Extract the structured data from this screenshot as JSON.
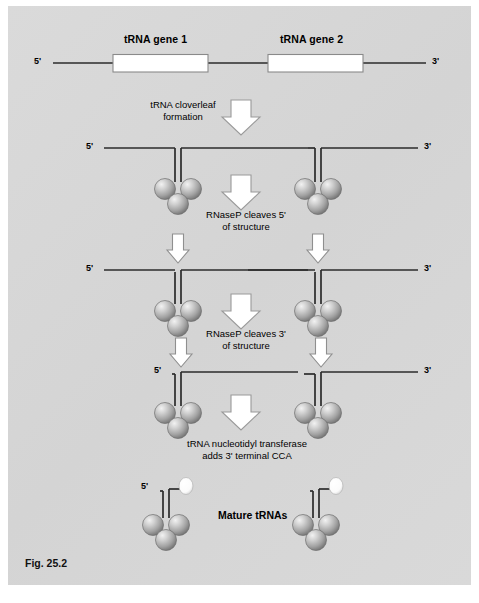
{
  "figure": {
    "caption": "Fig. 25.2",
    "background_color": "#d8d8d8",
    "line_color": "#2b2b2b",
    "sphere_color": "#9a9a9a",
    "arrow_fill": "#ffffff",
    "arrow_stroke": "#8c8c8c",
    "gene_box_fill": "#ffffff",
    "gene_box_stroke": "#8a8a8a"
  },
  "row1": {
    "name": "precursor-transcript",
    "gene1_label": "tRNA gene 1",
    "gene2_label": "tRNA gene 2",
    "five_prime": "5'",
    "three_prime": "3'"
  },
  "step1": {
    "line1": "tRNA cloverleaf",
    "line2": "formation",
    "arrow": "down-block-arrow"
  },
  "row2": {
    "name": "cloverleaf-structures",
    "five_prime": "5'",
    "three_prime": "3'",
    "structures": 2,
    "spheres_per_structure": 3
  },
  "step2": {
    "line1": "RNaseP cleaves 5'",
    "line2": "of structure",
    "arrow": "down-block-arrow"
  },
  "row3": {
    "name": "five-prime-cleaved-structures",
    "five_prime": "5'",
    "three_prime": "3'",
    "cleavage_arrows": 2
  },
  "step3": {
    "line1": "RNaseP cleaves 3'",
    "line2": "of structure",
    "arrow": "down-block-arrow"
  },
  "row4": {
    "name": "three-prime-cleaved-structures",
    "five_prime": "5'",
    "three_prime": "3'",
    "cleavage_arrows": 2
  },
  "step4": {
    "line1": "tRNA nucleotidyl transferase",
    "line2": "adds 3' terminal CCA",
    "arrow": "down-block-arrow"
  },
  "row5": {
    "name": "mature-trnas",
    "label": "Mature tRNAs",
    "five_prime": "5'",
    "cca_marker": "cca-terminal-oval"
  }
}
